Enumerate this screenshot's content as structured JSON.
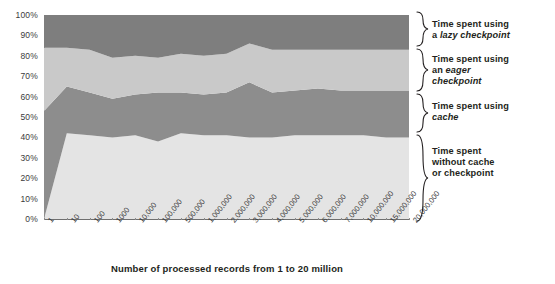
{
  "chart_data": {
    "type": "area",
    "stacked": true,
    "normalized": "percent",
    "title": "",
    "xlabel": "Number of processed records from 1 to 20 million",
    "ylabel": "",
    "ylim": [
      0,
      100
    ],
    "grid": false,
    "legend_position": "right",
    "categories": [
      "1",
      "10",
      "100",
      "1000",
      "10,000",
      "100,000",
      "500,000",
      "1,000,000",
      "2,000,000",
      "3,000,000",
      "4,000,000",
      "5,000,000",
      "6,000,000",
      "7,000,000",
      "10,000,000",
      "15,000,000",
      "20,000,000"
    ],
    "ytick_labels": [
      "0%",
      "10%",
      "20%",
      "30%",
      "40%",
      "50%",
      "60%",
      "70%",
      "80%",
      "90%",
      "100%"
    ],
    "ytick_values": [
      0,
      10,
      20,
      30,
      40,
      50,
      60,
      70,
      80,
      90,
      100
    ],
    "series": [
      {
        "name": "Time spent without cache or checkpoint",
        "color": "#e4e4e4",
        "values": [
          0,
          42,
          41,
          40,
          41,
          38,
          42,
          41,
          41,
          40,
          40,
          41,
          41,
          41,
          41,
          40,
          40
        ]
      },
      {
        "name": "Time spent using cache",
        "color": "#8d8d8d",
        "values": [
          53,
          23,
          21,
          19,
          20,
          24,
          20,
          20,
          21,
          27,
          22,
          22,
          23,
          22,
          22,
          23,
          23
        ]
      },
      {
        "name": "Time spent using an eager checkpoint",
        "color": "#c9c9c9",
        "values": [
          31,
          19,
          21,
          20,
          19,
          17,
          19,
          19,
          19,
          19,
          21,
          20,
          19,
          20,
          20,
          20,
          20
        ]
      },
      {
        "name": "Time spent using a lazy checkpoint",
        "color": "#7e7e7e",
        "values": [
          16,
          16,
          17,
          21,
          20,
          21,
          19,
          20,
          19,
          14,
          17,
          17,
          17,
          17,
          17,
          17,
          17
        ]
      }
    ],
    "cumulative_top_boundaries": {
      "note": "stacked upper edge of each band, percent",
      "band1_top": [
        0,
        42,
        41,
        40,
        41,
        38,
        42,
        41,
        41,
        40,
        40,
        41,
        41,
        41,
        41,
        40,
        40
      ],
      "band2_top": [
        53,
        65,
        62,
        59,
        61,
        62,
        62,
        61,
        62,
        67,
        62,
        63,
        64,
        63,
        63,
        63,
        63
      ],
      "band3_top": [
        84,
        84,
        83,
        79,
        80,
        79,
        81,
        80,
        81,
        86,
        83,
        83,
        83,
        83,
        83,
        83,
        83
      ],
      "band4_top": [
        100,
        100,
        100,
        100,
        100,
        100,
        100,
        100,
        100,
        100,
        100,
        100,
        100,
        100,
        100,
        100,
        100
      ]
    }
  },
  "legend": {
    "items": [
      {
        "line1": "Time spent using",
        "line2_pre": "a ",
        "line2_em": "lazy checkpoint",
        "line2_post": ""
      },
      {
        "line1": "Time spent using",
        "line2_pre": "an ",
        "line2_em": "eager",
        "line2_post": "",
        "line3_em": "checkpoint"
      },
      {
        "line1": "Time spent using",
        "line2_em": "cache"
      },
      {
        "line1": "Time spent",
        "line2": "without cache",
        "line3": "or checkpoint"
      }
    ]
  },
  "colors": {
    "band_lazy_checkpoint": "#7e7e7e",
    "band_eager_checkpoint": "#c9c9c9",
    "band_cache": "#8d8d8d",
    "band_no_cache": "#e4e4e4",
    "axis": "#6f6f6f",
    "text": "#231f20"
  }
}
